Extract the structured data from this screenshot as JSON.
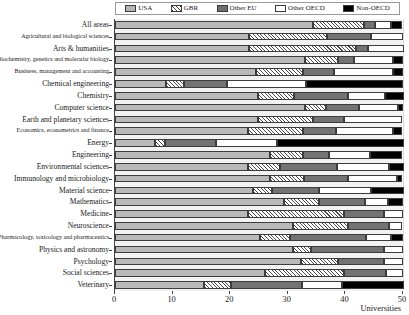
{
  "chart_data": {
    "type": "bar",
    "orientation": "horizontal",
    "stacked": true,
    "title": "",
    "xlabel": "Universities",
    "ylabel": "",
    "xlim": [
      0,
      50
    ],
    "xticks": [
      0,
      10,
      20,
      30,
      40,
      50
    ],
    "xticklabels": [
      "0",
      "10",
      "20",
      "30",
      "40",
      "50"
    ],
    "grid": true,
    "legend_position": "top",
    "legend": [
      "USA",
      "GBR",
      "Other EU",
      "Other OECD",
      "Non-OECD"
    ],
    "colors": {
      "USA": "#b9b9b9",
      "GBR": "#ffffff-hatched",
      "Other EU": "#737373",
      "Other OECD": "#ffffff",
      "Non-OECD": "#000000"
    },
    "categories": [
      "All areas",
      "Agricultural and biological sciences",
      "Arts & humanities",
      "Biochemistry, genetics and molecular biology",
      "Business, management and accounting",
      "Chemical engineering",
      "Chemistry",
      "Computer science",
      "Earth and planetary sciences",
      "Economics, econometrics and finance",
      "Energy",
      "Engineering",
      "Environmental sciences",
      "Immunology and microbiology",
      "Material science",
      "Mathematics",
      "Medicine",
      "Neuroscience",
      "Pharmacology, toxicology and pharmaceutics",
      "Physics and astronomy",
      "Psychology",
      "Social sciences",
      "Veterinary"
    ],
    "series": [
      {
        "name": "USA",
        "values": [
          34.4,
          23.3,
          23.3,
          33.0,
          24.5,
          8.9,
          24.8,
          33.0,
          24.8,
          23.1,
          7.0,
          26.9,
          23.1,
          26.9,
          24.0,
          29.3,
          23.1,
          30.9,
          25.2,
          30.9,
          32.3,
          26.0,
          15.5
        ]
      },
      {
        "name": "GBR",
        "values": [
          8.9,
          13.5,
          18.6,
          5.7,
          8.2,
          3.1,
          6.3,
          3.6,
          9.5,
          9.5,
          1.6,
          5.7,
          5.6,
          5.9,
          3.3,
          6.1,
          16.7,
          9.5,
          5.2,
          3.1,
          6.4,
          13.7,
          4.7
        ]
      },
      {
        "name": "Other EU",
        "values": [
          1.9,
          7.6,
          2.1,
          2.8,
          5.4,
          7.5,
          9.4,
          5.7,
          5.4,
          5.7,
          9.0,
          4.5,
          9.9,
          7.6,
          8.2,
          8.0,
          6.9,
          7.1,
          13.2,
          12.7,
          8.0,
          7.3,
          12.2
        ]
      },
      {
        "name": "Other OECD",
        "values": [
          2.8,
          5.6,
          6.1,
          6.8,
          10.2,
          13.7,
          6.3,
          6.8,
          10.2,
          9.9,
          10.6,
          7.1,
          8.9,
          8.5,
          9.0,
          4.0,
          3.3,
          2.4,
          4.3,
          3.3,
          3.3,
          3.0,
          7.1
        ]
      },
      {
        "name": "Non-OECD",
        "values": [
          1.9,
          0.0,
          0.0,
          1.7,
          1.7,
          16.8,
          3.3,
          0.9,
          0.0,
          1.7,
          21.9,
          5.7,
          2.6,
          1.0,
          5.6,
          2.6,
          0.0,
          0.0,
          2.1,
          0.0,
          0.0,
          0.0,
          10.6
        ]
      }
    ]
  },
  "legend": {
    "items": [
      {
        "label": "USA",
        "key": "usa"
      },
      {
        "label": "GBR",
        "key": "gbr"
      },
      {
        "label": "Other EU",
        "key": "eu"
      },
      {
        "label": "Other OECD",
        "key": "oecd"
      },
      {
        "label": "Non-OECD",
        "key": "non"
      }
    ]
  },
  "axis": {
    "x_title": "Universities"
  }
}
